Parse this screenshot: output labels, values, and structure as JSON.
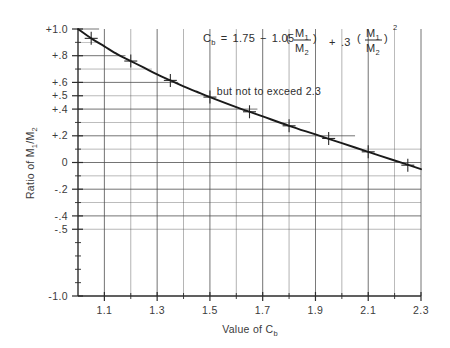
{
  "chart_data": {
    "type": "line",
    "title": "",
    "xlabel": "Value of C",
    "xlabel_sub": "b",
    "ylabel": "Ratio of M",
    "ylabel_sub1": "1",
    "ylabel_mid": "/M",
    "ylabel_sub2": "2",
    "xlim": [
      1.0,
      2.3
    ],
    "ylim": [
      -1.0,
      1.0
    ],
    "grid": true,
    "legend": null,
    "x_ticks_major": [
      1.1,
      1.3,
      1.5,
      1.7,
      1.9,
      2.1,
      2.3
    ],
    "x_tick_labels": [
      "1.1",
      "1.3",
      "1.5",
      "1.7",
      "1.9",
      "2.1",
      "2.3"
    ],
    "x_ticks_minor": [
      1.2,
      1.4,
      1.6,
      1.8,
      2.0,
      2.2
    ],
    "y_ticks_labeled": [
      1.0,
      0.8,
      0.6,
      0.5,
      0.4,
      0.2,
      0.0,
      -0.2,
      -0.4,
      -0.5,
      -1.0
    ],
    "y_tick_labels": [
      "+1.0",
      "+.8",
      "+.6",
      "+.5",
      "+.4",
      "+.2",
      "0",
      "-.2",
      "-.4",
      "-.5",
      "-1.0"
    ],
    "y_gridlines": [
      1.0,
      0.9,
      0.8,
      0.7,
      0.6,
      0.5,
      0.4,
      0.3,
      0.2,
      0.1,
      0.0,
      -0.1,
      -0.2,
      -0.3,
      -0.4,
      -0.5
    ],
    "curve_name": "Cb vs M1/M2",
    "curve_points": [
      {
        "x": 1.0,
        "y": 1.0
      },
      {
        "x": 1.05,
        "y": 0.93
      },
      {
        "x": 1.1,
        "y": 0.87
      },
      {
        "x": 1.15,
        "y": 0.81
      },
      {
        "x": 1.2,
        "y": 0.76
      },
      {
        "x": 1.25,
        "y": 0.71
      },
      {
        "x": 1.3,
        "y": 0.66
      },
      {
        "x": 1.35,
        "y": 0.615
      },
      {
        "x": 1.4,
        "y": 0.57
      },
      {
        "x": 1.45,
        "y": 0.53
      },
      {
        "x": 1.5,
        "y": 0.49
      },
      {
        "x": 1.6,
        "y": 0.415
      },
      {
        "x": 1.7,
        "y": 0.345
      },
      {
        "x": 1.8,
        "y": 0.275
      },
      {
        "x": 1.9,
        "y": 0.21
      },
      {
        "x": 2.0,
        "y": 0.145
      },
      {
        "x": 2.1,
        "y": 0.08
      },
      {
        "x": 2.2,
        "y": 0.015
      },
      {
        "x": 2.3,
        "y": -0.05
      }
    ],
    "data_markers": [
      {
        "x": 1.05,
        "y": 0.93
      },
      {
        "x": 1.2,
        "y": 0.76
      },
      {
        "x": 1.35,
        "y": 0.615
      },
      {
        "x": 1.5,
        "y": 0.49
      },
      {
        "x": 1.65,
        "y": 0.38
      },
      {
        "x": 1.8,
        "y": 0.275
      },
      {
        "x": 1.95,
        "y": 0.18
      },
      {
        "x": 2.1,
        "y": 0.08
      },
      {
        "x": 2.25,
        "y": -0.02
      }
    ],
    "stepped_gridline_tips": [
      {
        "y": 1.0,
        "x_end": 1.08
      },
      {
        "y": 0.9,
        "x_end": 1.07
      },
      {
        "y": 0.8,
        "x_end": 1.18
      },
      {
        "y": 0.7,
        "x_end": 1.28
      },
      {
        "y": 0.6,
        "x_end": 1.38
      },
      {
        "y": 0.5,
        "x_end": 1.5
      },
      {
        "y": 0.4,
        "x_end": 1.68
      },
      {
        "y": 0.3,
        "x_end": 1.88
      },
      {
        "y": 0.2,
        "x_end": 2.05
      }
    ]
  },
  "formula": {
    "lhs": "C",
    "lhs_sub": "b",
    "equals": "=",
    "const_a": "1.75",
    "minus": "−",
    "coef_b": "1.05",
    "frac_num": "M",
    "frac_num_sub": "1",
    "frac_den": "M",
    "frac_den_sub": "2",
    "plus": "+",
    "coef_c": ".3",
    "exponent": "2"
  },
  "note": {
    "text": "but not to exceed 2.3"
  },
  "colors": {
    "curve": "#1a1a1a",
    "grid": "#4a4a4a",
    "axis": "#2b2b2b",
    "text": "#333333",
    "background": "#ffffff"
  }
}
